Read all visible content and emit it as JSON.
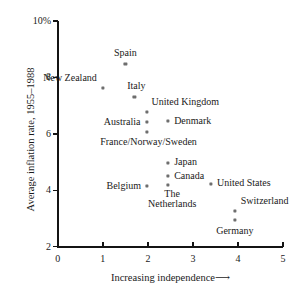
{
  "chart_data": {
    "type": "scatter",
    "title": "",
    "xlabel": "Increasing independence ⟶",
    "ylabel": "Average inflation rate, 1955–1988",
    "xlim": [
      0,
      5
    ],
    "ylim": [
      2,
      10
    ],
    "grid": false,
    "legend": "none",
    "x_ticks": [
      "0",
      "1",
      "2",
      "3",
      "4",
      "5"
    ],
    "x_tick_values": [
      0,
      1,
      2,
      3,
      4,
      5
    ],
    "y_ticks": [
      "2",
      "4",
      "6",
      "8",
      "10%"
    ],
    "y_tick_values": [
      2,
      4,
      6,
      8,
      10
    ],
    "points": [
      {
        "label": "Spain",
        "x": 1.5,
        "y": 8.48,
        "label_pos": "above",
        "label_dx": 0,
        "label_dy": -11
      },
      {
        "label": "New Zealand",
        "x": 1.0,
        "y": 7.63,
        "label_pos": "above-left",
        "label_dx": -6,
        "label_dy": -10
      },
      {
        "label": "Italy",
        "x": 1.7,
        "y": 7.31,
        "label_pos": "above",
        "label_dx": 2,
        "label_dy": -11
      },
      {
        "label": "United Kingdom",
        "x": 1.97,
        "y": 6.78,
        "label_pos": "above-right",
        "label_dx": 5,
        "label_dy": -10
      },
      {
        "label": "Denmark",
        "x": 2.45,
        "y": 6.45,
        "label_pos": "right",
        "label_dx": 6,
        "label_dy": 0
      },
      {
        "label": "Australia",
        "x": 1.97,
        "y": 6.42,
        "label_pos": "left",
        "label_dx": -6,
        "label_dy": 0
      },
      {
        "label": "France/Norway/Sweden",
        "x": 1.97,
        "y": 6.07,
        "label_pos": "below-left",
        "label_dx": 2,
        "label_dy": 10
      },
      {
        "label": "Japan",
        "x": 2.45,
        "y": 4.97,
        "label_pos": "right",
        "label_dx": 6,
        "label_dy": -1
      },
      {
        "label": "Canada",
        "x": 2.45,
        "y": 4.51,
        "label_pos": "right",
        "label_dx": 6,
        "label_dy": 0
      },
      {
        "label": "The\nNetherlands",
        "x": 2.45,
        "y": 4.19,
        "label_pos": "below",
        "label_dx": 4,
        "label_dy": 14
      },
      {
        "label": "Belgium",
        "x": 1.98,
        "y": 4.15,
        "label_pos": "left",
        "label_dx": -6,
        "label_dy": 0
      },
      {
        "label": "United States",
        "x": 3.4,
        "y": 4.22,
        "label_pos": "right",
        "label_dx": 6,
        "label_dy": -1
      },
      {
        "label": "Switzerland",
        "x": 3.93,
        "y": 3.27,
        "label_pos": "above-right",
        "label_dx": 6,
        "label_dy": -10
      },
      {
        "label": "Germany",
        "x": 3.93,
        "y": 2.95,
        "label_pos": "below",
        "label_dx": 0,
        "label_dy": 11
      }
    ]
  },
  "axes": {
    "x_title": "Increasing independence",
    "x_arrow": "⟶",
    "y_title": "Average inflation rate, 1955–1988"
  }
}
